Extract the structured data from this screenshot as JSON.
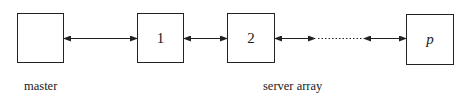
{
  "diagram": {
    "nodes": [
      {
        "id": "master",
        "label": "",
        "x": 17,
        "y": 13,
        "w": 47,
        "h": 50
      },
      {
        "id": "server-1",
        "label": "1",
        "x": 137,
        "y": 13,
        "w": 47,
        "h": 50
      },
      {
        "id": "server-2",
        "label": "2",
        "x": 227,
        "y": 13,
        "w": 48,
        "h": 50
      },
      {
        "id": "server-p",
        "label": "p",
        "x": 406,
        "y": 14,
        "w": 48,
        "h": 51
      }
    ],
    "edges": [
      {
        "from": "master",
        "to": "server-1",
        "style": "double-arrow"
      },
      {
        "from": "server-1",
        "to": "server-2",
        "style": "double-arrow"
      },
      {
        "from": "server-2",
        "to": "ellipsis",
        "style": "double-arrow"
      },
      {
        "from": "ellipsis",
        "to": "server-p",
        "style": "double-arrow",
        "note": "dotted gap indicates omitted servers"
      }
    ],
    "captions": {
      "master": "master",
      "server_array": "server array"
    }
  }
}
